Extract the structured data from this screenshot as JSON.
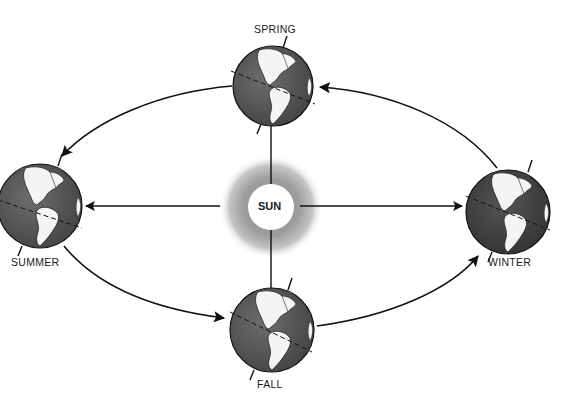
{
  "diagram": {
    "type": "seasons-orbit",
    "center_label": "SUN",
    "seasons": [
      {
        "id": "spring",
        "label": "SPRING",
        "position": "top"
      },
      {
        "id": "summer",
        "label": "SUMMER",
        "position": "left"
      },
      {
        "id": "fall",
        "label": "FALL",
        "position": "bottom"
      },
      {
        "id": "winter",
        "label": "WINTER",
        "position": "right"
      }
    ],
    "orbit_direction": "counterclockwise as drawn: winter → spring → summer → fall → winter",
    "colors": {
      "background": "#ffffff",
      "ocean": "#5a5a5a",
      "land": "#f4f4f4",
      "line": "#111111",
      "sun_haze": "#9a9a9a"
    }
  }
}
